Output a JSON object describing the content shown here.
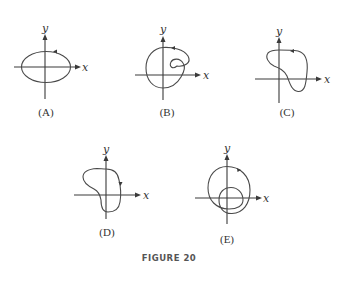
{
  "figure": {
    "caption": "FIGURE 20",
    "panels": [
      {
        "id": "A",
        "label": "(A)",
        "x_axis_label": "x",
        "y_axis_label": "y",
        "curve": "ellipse",
        "direction": "counterclockwise"
      },
      {
        "id": "B",
        "label": "(B)",
        "x_axis_label": "x",
        "y_axis_label": "y",
        "curve": "spiral loop with inner curl",
        "direction": "counterclockwise"
      },
      {
        "id": "C",
        "label": "(C)",
        "x_axis_label": "x",
        "y_axis_label": "y",
        "curve": "irregular closed loop",
        "direction": "counterclockwise"
      },
      {
        "id": "D",
        "label": "(D)",
        "x_axis_label": "x",
        "y_axis_label": "y",
        "curve": "irregular closed loop",
        "direction": "clockwise"
      },
      {
        "id": "E",
        "label": "(E)",
        "x_axis_label": "x",
        "y_axis_label": "y",
        "curve": "double loop",
        "direction": "clockwise"
      }
    ]
  }
}
